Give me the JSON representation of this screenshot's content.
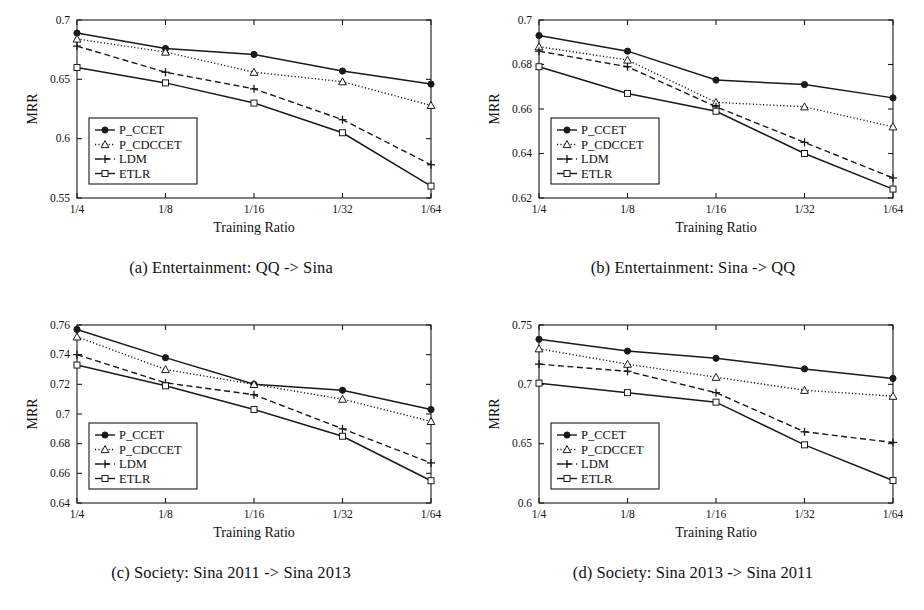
{
  "figure": {
    "shared": {
      "xlabel": "Training Ratio",
      "ylabel": "MRR",
      "categories": [
        "1/4",
        "1/8",
        "1/16",
        "1/32",
        "1/64"
      ],
      "legend_entries": [
        "P_CCET",
        "P_CDCCET",
        "LDM",
        "ETLR"
      ],
      "legend_position": "lower-left",
      "grid": false,
      "line_color": "#1a1a1a"
    },
    "panels": [
      {
        "id": "a",
        "caption": "(a) Entertainment: QQ -> Sina"
      },
      {
        "id": "b",
        "caption": "(b) Entertainment: Sina -> QQ"
      },
      {
        "id": "c",
        "caption": "(c) Society: Sina 2011 -> Sina 2013"
      },
      {
        "id": "d",
        "caption": "(d) Society: Sina 2013 -> Sina 2011"
      }
    ]
  },
  "chart_data": [
    {
      "type": "line",
      "panel": "a",
      "title": "(a) Entertainment: QQ -> Sina",
      "xlabel": "Training Ratio",
      "ylabel": "MRR",
      "categories": [
        "1/4",
        "1/8",
        "1/16",
        "1/32",
        "1/64"
      ],
      "ylim": [
        0.55,
        0.7
      ],
      "yticks": [
        0.55,
        0.6,
        0.65,
        0.7
      ],
      "ytick_labels": [
        "0.55",
        "0.6",
        "0.65",
        "0.7"
      ],
      "grid": false,
      "legend_position": "lower-left",
      "series": [
        {
          "name": "P_CCET",
          "marker": "filled-circle",
          "dash": "solid",
          "values": [
            0.689,
            0.676,
            0.671,
            0.657,
            0.646
          ]
        },
        {
          "name": "P_CDCCET",
          "marker": "open-triangle",
          "dash": "dotted",
          "values": [
            0.684,
            0.673,
            0.656,
            0.648,
            0.628
          ]
        },
        {
          "name": "LDM",
          "marker": "plus",
          "dash": "dashed",
          "values": [
            0.678,
            0.656,
            0.642,
            0.616,
            0.578
          ]
        },
        {
          "name": "ETLR",
          "marker": "open-square",
          "dash": "solid",
          "values": [
            0.66,
            0.647,
            0.63,
            0.605,
            0.56
          ]
        }
      ]
    },
    {
      "type": "line",
      "panel": "b",
      "title": "(b) Entertainment: Sina -> QQ",
      "xlabel": "Training Ratio",
      "ylabel": "MRR",
      "categories": [
        "1/4",
        "1/8",
        "1/16",
        "1/32",
        "1/64"
      ],
      "ylim": [
        0.62,
        0.7
      ],
      "yticks": [
        0.62,
        0.64,
        0.66,
        0.68,
        0.7
      ],
      "ytick_labels": [
        "0.62",
        "0.64",
        "0.66",
        "0.68",
        "0.7"
      ],
      "grid": false,
      "legend_position": "lower-left",
      "series": [
        {
          "name": "P_CCET",
          "marker": "filled-circle",
          "dash": "solid",
          "values": [
            0.693,
            0.686,
            0.673,
            0.671,
            0.665
          ]
        },
        {
          "name": "P_CDCCET",
          "marker": "open-triangle",
          "dash": "dotted",
          "values": [
            0.688,
            0.682,
            0.663,
            0.661,
            0.652
          ]
        },
        {
          "name": "LDM",
          "marker": "plus",
          "dash": "dashed",
          "values": [
            0.686,
            0.679,
            0.661,
            0.645,
            0.629
          ]
        },
        {
          "name": "ETLR",
          "marker": "open-square",
          "dash": "solid",
          "values": [
            0.679,
            0.667,
            0.659,
            0.64,
            0.624
          ]
        }
      ]
    },
    {
      "type": "line",
      "panel": "c",
      "title": "(c) Society: Sina 2011 -> Sina 2013",
      "xlabel": "Training Ratio",
      "ylabel": "MRR",
      "categories": [
        "1/4",
        "1/8",
        "1/16",
        "1/32",
        "1/64"
      ],
      "ylim": [
        0.64,
        0.76
      ],
      "yticks": [
        0.64,
        0.66,
        0.68,
        0.7,
        0.72,
        0.74,
        0.76
      ],
      "ytick_labels": [
        "0.64",
        "0.66",
        "0.68",
        "0.7",
        "0.72",
        "0.74",
        "0.76"
      ],
      "grid": false,
      "legend_position": "lower-left",
      "series": [
        {
          "name": "P_CCET",
          "marker": "filled-circle",
          "dash": "solid",
          "values": [
            0.757,
            0.738,
            0.72,
            0.716,
            0.703
          ]
        },
        {
          "name": "P_CDCCET",
          "marker": "open-triangle",
          "dash": "dotted",
          "values": [
            0.752,
            0.73,
            0.72,
            0.71,
            0.695
          ]
        },
        {
          "name": "LDM",
          "marker": "plus",
          "dash": "dashed",
          "values": [
            0.74,
            0.721,
            0.713,
            0.69,
            0.667
          ]
        },
        {
          "name": "ETLR",
          "marker": "open-square",
          "dash": "solid",
          "values": [
            0.733,
            0.719,
            0.703,
            0.685,
            0.655
          ]
        }
      ]
    },
    {
      "type": "line",
      "panel": "d",
      "title": "(d) Society: Sina 2013 -> Sina 2011",
      "xlabel": "Training Ratio",
      "ylabel": "MRR",
      "categories": [
        "1/4",
        "1/8",
        "1/16",
        "1/32",
        "1/64"
      ],
      "ylim": [
        0.6,
        0.75
      ],
      "yticks": [
        0.6,
        0.65,
        0.7,
        0.75
      ],
      "ytick_labels": [
        "0.6",
        "0.65",
        "0.7",
        "0.75"
      ],
      "grid": false,
      "legend_position": "lower-left",
      "series": [
        {
          "name": "P_CCET",
          "marker": "filled-circle",
          "dash": "solid",
          "values": [
            0.738,
            0.728,
            0.722,
            0.713,
            0.705
          ]
        },
        {
          "name": "P_CDCCET",
          "marker": "open-triangle",
          "dash": "dotted",
          "values": [
            0.73,
            0.717,
            0.706,
            0.695,
            0.69
          ]
        },
        {
          "name": "LDM",
          "marker": "plus",
          "dash": "dashed",
          "values": [
            0.717,
            0.711,
            0.693,
            0.66,
            0.651
          ]
        },
        {
          "name": "ETLR",
          "marker": "open-square",
          "dash": "solid",
          "values": [
            0.701,
            0.693,
            0.685,
            0.649,
            0.619
          ]
        }
      ]
    }
  ]
}
